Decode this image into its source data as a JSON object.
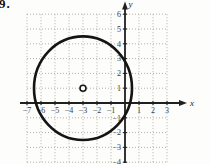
{
  "problem_number": "9.",
  "chart_data": {
    "type": "scatter",
    "title": "",
    "xlabel": "x",
    "ylabel": "y",
    "xlim": [
      -7,
      3
    ],
    "ylim": [
      -4,
      6
    ],
    "grid": true,
    "x_ticks": [
      -7,
      -6,
      -5,
      -4,
      -3,
      -2,
      -1,
      1,
      2,
      3
    ],
    "y_ticks": [
      -4,
      -3,
      -2,
      -1,
      1,
      2,
      3,
      4,
      5,
      6
    ],
    "points": [
      {
        "x": -3,
        "y": 1,
        "marker": "open-circle",
        "role": "center"
      }
    ],
    "shapes": [
      {
        "shape": "circle",
        "center_x": -3,
        "center_y": 1,
        "radius": 3.5
      }
    ]
  },
  "colors": {
    "axis": "#1f1f1f",
    "curve": "#141414",
    "grid": "#aca89f",
    "label": "#3c3c3c",
    "marker_fill": "#fdfdfb",
    "background": "#fdfdfb"
  }
}
